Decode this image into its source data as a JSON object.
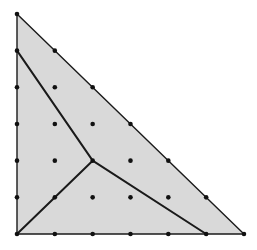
{
  "diagram": {
    "type": "lattice-triangle-subdivision",
    "grid": {
      "n": 6,
      "origin_px": [
        17,
        234
      ],
      "dx_px": 37.83,
      "dy_px": 36.67
    },
    "colors": {
      "fill": "#d9d9d9",
      "stroke": "#1a1a1a",
      "dot": "#111111",
      "background": "#ffffff"
    },
    "triangle": {
      "vertices": [
        [
          0,
          0
        ],
        [
          6,
          0
        ],
        [
          0,
          6
        ]
      ]
    },
    "junction": [
      2,
      2
    ],
    "segments": [
      {
        "from": [
          2,
          2
        ],
        "to": [
          0,
          0
        ]
      },
      {
        "from": [
          2,
          2
        ],
        "to": [
          0,
          5
        ]
      },
      {
        "from": [
          2,
          2
        ],
        "to": [
          5,
          0
        ]
      }
    ],
    "dots": "all lattice points (i,j) with i>=0, j>=0, i+j<=6"
  }
}
